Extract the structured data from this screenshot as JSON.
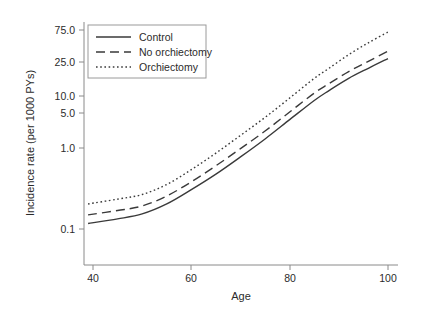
{
  "chart_data": {
    "type": "line",
    "title": "",
    "xlabel": "Age",
    "ylabel": "Incidence rate (per 1000 PYs)",
    "xlim": [
      39,
      100
    ],
    "ylim": [
      0.075,
      90
    ],
    "yscale": "log",
    "xscale": "linear",
    "grid": false,
    "legend_position": "top-left",
    "xticks": [
      40,
      60,
      80,
      100
    ],
    "xtick_labels": [
      "40",
      "60",
      "80",
      "100"
    ],
    "yticks": [
      0.1,
      1.0,
      5.0,
      10.0,
      25.0,
      75.0
    ],
    "ytick_labels": [
      "0.1",
      "1.0",
      "5.0",
      "10.0",
      "25.0",
      "75.0"
    ],
    "x": [
      39,
      45,
      50,
      55,
      60,
      65,
      70,
      75,
      80,
      85,
      88,
      92,
      96,
      100
    ],
    "series": [
      {
        "name": "Control",
        "style": "solid",
        "color": "#3a3a3a",
        "values": [
          0.12,
          0.14,
          0.165,
          0.23,
          0.37,
          0.62,
          1.1,
          2.0,
          3.8,
          7.2,
          10.0,
          15.0,
          21.0,
          29.0
        ]
      },
      {
        "name": "No orchiectomy",
        "style": "dashed",
        "color": "#3a3a3a",
        "values": [
          0.16,
          0.185,
          0.215,
          0.3,
          0.48,
          0.82,
          1.45,
          2.6,
          4.9,
          9.2,
          12.6,
          18.8,
          26.5,
          37.0
        ]
      },
      {
        "name": "Orchiectomy",
        "style": "dotted",
        "color": "#3a3a3a",
        "values": [
          0.23,
          0.27,
          0.315,
          0.44,
          0.72,
          1.25,
          2.25,
          4.1,
          7.8,
          15.0,
          21.0,
          33.0,
          49.0,
          70.0
        ]
      }
    ]
  },
  "legend": {
    "items": [
      {
        "label": "Control",
        "style": "solid"
      },
      {
        "label": "No orchiectomy",
        "style": "dashed"
      },
      {
        "label": "Orchiectomy",
        "style": "dotted"
      }
    ]
  },
  "axes": {
    "x_title": "Age",
    "y_title": "Incidence rate (per 1000 PYs)"
  },
  "colors": {
    "line": "#3a3a3a",
    "axis": "#8a8a8a",
    "text": "#2b2b2b",
    "background": "#ffffff",
    "legend_border": "#9a9a9a"
  }
}
